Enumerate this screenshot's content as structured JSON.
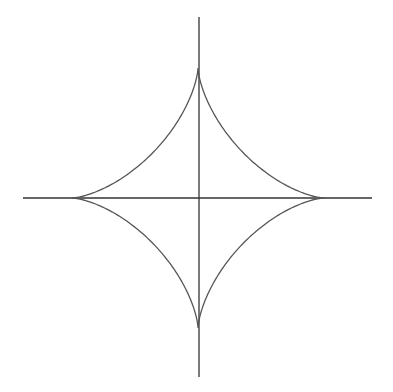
{
  "diagram": {
    "title": "",
    "type": "astroid",
    "colors": {
      "background": "#ffffff",
      "axis": "#333333",
      "curve": "#555555"
    },
    "center": {
      "x": 198,
      "y": 198
    },
    "radius_x": 126,
    "radius_y": 130,
    "axes": {
      "horizontal": {
        "x1": 23,
        "x2": 372,
        "y": 198
      },
      "vertical": {
        "y1": 17,
        "y2": 377,
        "x": 199
      }
    },
    "cusps": [
      {
        "name": "top",
        "x": 199,
        "y": 67
      },
      {
        "name": "right",
        "x": 323,
        "y": 198
      },
      {
        "name": "bottom",
        "x": 199,
        "y": 328
      },
      {
        "name": "left",
        "x": 71,
        "y": 198
      }
    ]
  }
}
